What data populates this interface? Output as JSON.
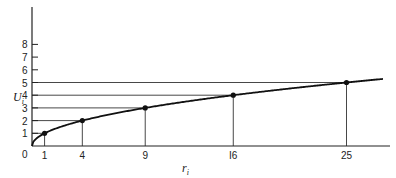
{
  "chart_data": {
    "type": "line",
    "title": "",
    "xlabel": "r",
    "xlabel_sub": "i",
    "ylabel": "U",
    "ylabel_sub": "i",
    "x_ticks": [
      1,
      4,
      9,
      16,
      25
    ],
    "x_tick_labels": [
      "1",
      "4",
      "9",
      "I6",
      "25"
    ],
    "y_ticks": [
      1,
      2,
      3,
      4,
      5,
      6,
      7,
      8
    ],
    "y_tick_labels": [
      "1",
      "2",
      "3",
      "4",
      "5",
      "6",
      "7",
      "8"
    ],
    "origin_label": "0",
    "points": [
      {
        "x": 1,
        "y": 1
      },
      {
        "x": 4,
        "y": 2
      },
      {
        "x": 9,
        "y": 3
      },
      {
        "x": 16,
        "y": 4
      },
      {
        "x": 25,
        "y": 5
      }
    ],
    "curve": "U = sqrt(r)",
    "xlim": [
      0,
      28
    ],
    "ylim": [
      0,
      10.5
    ],
    "grid": false,
    "legend": null,
    "annotations": "Drop lines from each point to both axes"
  }
}
